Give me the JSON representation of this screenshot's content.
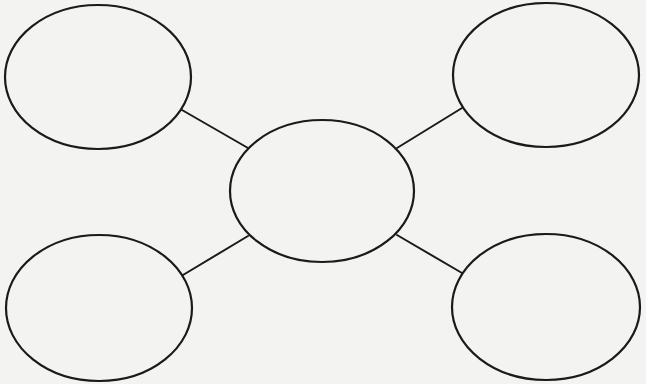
{
  "diagram": {
    "type": "bubble-map",
    "background_color": "#f3f3f2",
    "stroke_color": "#1a1a1a",
    "center_node": {
      "id": "center",
      "cx": 322,
      "cy": 191,
      "rx": 92,
      "ry": 71,
      "label": ""
    },
    "outer_nodes": [
      {
        "id": "top-left",
        "cx": 98,
        "cy": 77,
        "rx": 93,
        "ry": 72,
        "label": ""
      },
      {
        "id": "top-right",
        "cx": 546,
        "cy": 75,
        "rx": 93,
        "ry": 72,
        "label": ""
      },
      {
        "id": "bottom-left",
        "cx": 99,
        "cy": 308,
        "rx": 93,
        "ry": 73,
        "label": ""
      },
      {
        "id": "bottom-right",
        "cx": 546,
        "cy": 307,
        "rx": 94,
        "ry": 73,
        "label": ""
      }
    ],
    "edges": [
      {
        "from": "top-left",
        "to": "center",
        "x1": 182,
        "y1": 110,
        "x2": 248,
        "y2": 148
      },
      {
        "from": "top-right",
        "to": "center",
        "x1": 462,
        "y1": 108,
        "x2": 397,
        "y2": 148
      },
      {
        "from": "bottom-left",
        "to": "center",
        "x1": 183,
        "y1": 275,
        "x2": 248,
        "y2": 236
      },
      {
        "from": "bottom-right",
        "to": "center",
        "x1": 462,
        "y1": 273,
        "x2": 397,
        "y2": 235
      }
    ]
  }
}
